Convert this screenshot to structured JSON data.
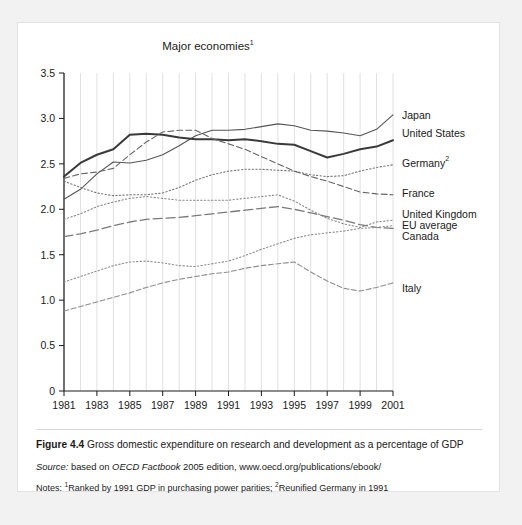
{
  "figure": {
    "caption_number": "Figure 4.4",
    "caption_text": " Gross domestic expenditure on research and development as a percentage of GDP",
    "source_lead": "Source:",
    "source_rest_a": " based on ",
    "source_italic": "OECD Factbook",
    "source_rest_b": " 2005 edition, www.oecd.org/publications/ebook/",
    "notes_lead": "Notes: ",
    "notes_sup1": "1",
    "notes_text1": "Ranked by 1991 GDP in purchasing power parities; ",
    "notes_sup2": "2",
    "notes_text2": "Reunified Germany in 1991"
  },
  "chart_data": {
    "type": "line",
    "title": "Major economies",
    "title_superscript": "1",
    "xlabel": "",
    "ylabel": "",
    "xlim": [
      1981,
      2001
    ],
    "ylim": [
      0,
      3.5
    ],
    "grid": true,
    "legend_position": "right-inline",
    "x": [
      1981,
      1982,
      1983,
      1984,
      1985,
      1986,
      1987,
      1988,
      1989,
      1990,
      1991,
      1992,
      1993,
      1994,
      1995,
      1996,
      1997,
      1998,
      1999,
      2000,
      2001
    ],
    "xticks": [
      1981,
      1983,
      1985,
      1987,
      1989,
      1991,
      1993,
      1995,
      1997,
      1999,
      2001
    ],
    "yticks": [
      "0",
      "0.5",
      "1.0",
      "1.5",
      "2.0",
      "2.5",
      "3.0",
      "3.5"
    ],
    "ytick_values": [
      0,
      0.5,
      1.0,
      1.5,
      2.0,
      2.5,
      3.0,
      3.5
    ],
    "series": [
      {
        "name": "Japan",
        "label": "Japan",
        "style": "solid",
        "width": 1.1,
        "color": "#555555",
        "values": [
          2.11,
          2.22,
          2.39,
          2.52,
          2.51,
          2.54,
          2.6,
          2.7,
          2.81,
          2.87,
          2.87,
          2.88,
          2.91,
          2.94,
          2.92,
          2.87,
          2.86,
          2.84,
          2.81,
          2.88,
          3.04
        ]
      },
      {
        "name": "United States",
        "label": "United States",
        "style": "solid",
        "width": 2.0,
        "color": "#3a3a3a",
        "values": [
          2.36,
          2.51,
          2.6,
          2.66,
          2.82,
          2.83,
          2.82,
          2.79,
          2.77,
          2.77,
          2.76,
          2.77,
          2.75,
          2.72,
          2.71,
          2.64,
          2.57,
          2.61,
          2.66,
          2.69,
          2.76
        ]
      },
      {
        "name": "Germany",
        "label": "Germany",
        "label_superscript": "2",
        "style": "dotted",
        "width": 1.1,
        "color": "#777777",
        "values": [
          2.31,
          2.24,
          2.18,
          2.15,
          2.16,
          2.16,
          2.18,
          2.24,
          2.32,
          2.38,
          2.42,
          2.44,
          2.44,
          2.43,
          2.42,
          2.38,
          2.36,
          2.37,
          2.42,
          2.46,
          2.49
        ]
      },
      {
        "name": "France",
        "label": "France",
        "style": "dashed",
        "width": 1.1,
        "color": "#666666",
        "values": [
          2.34,
          2.39,
          2.41,
          2.45,
          2.6,
          2.74,
          2.85,
          2.87,
          2.87,
          2.78,
          2.72,
          2.66,
          2.58,
          2.5,
          2.42,
          2.36,
          2.31,
          2.25,
          2.19,
          2.17,
          2.16
        ]
      },
      {
        "name": "United Kingdom",
        "label": "United Kingdom",
        "style": "dotted",
        "width": 1.1,
        "color": "#8a8a8a",
        "values": [
          1.89,
          1.95,
          2.03,
          2.08,
          2.12,
          2.14,
          2.12,
          2.1,
          2.1,
          2.1,
          2.1,
          2.12,
          2.14,
          2.16,
          2.09,
          1.99,
          1.9,
          1.84,
          1.8,
          1.86,
          1.88
        ]
      },
      {
        "name": "EU average",
        "label": "EU average",
        "style": "longdash",
        "width": 1.3,
        "color": "#7a7a7a",
        "values": [
          1.7,
          1.73,
          1.77,
          1.82,
          1.86,
          1.89,
          1.9,
          1.91,
          1.93,
          1.95,
          1.97,
          1.99,
          2.01,
          2.03,
          2.0,
          1.96,
          1.92,
          1.88,
          1.83,
          1.8,
          1.79
        ]
      },
      {
        "name": "Canada",
        "label": "Canada",
        "style": "dotted",
        "width": 1.1,
        "color": "#8e8e8e",
        "values": [
          1.2,
          1.26,
          1.32,
          1.38,
          1.42,
          1.43,
          1.41,
          1.38,
          1.37,
          1.4,
          1.43,
          1.49,
          1.56,
          1.62,
          1.68,
          1.72,
          1.74,
          1.76,
          1.79,
          1.8,
          1.82
        ]
      },
      {
        "name": "Italy",
        "label": "Italy",
        "style": "dashdot",
        "width": 1.1,
        "color": "#8e8e8e",
        "values": [
          0.88,
          0.93,
          0.98,
          1.03,
          1.08,
          1.14,
          1.19,
          1.23,
          1.26,
          1.29,
          1.31,
          1.35,
          1.38,
          1.4,
          1.42,
          1.31,
          1.21,
          1.13,
          1.1,
          1.14,
          1.19
        ]
      }
    ],
    "label_positions": [
      {
        "name": "Japan",
        "y": 3.03
      },
      {
        "name": "United States",
        "y": 2.83
      },
      {
        "name": "Germany",
        "y": 2.5
      },
      {
        "name": "France",
        "y": 2.18
      },
      {
        "name": "United Kingdom",
        "y": 1.94
      },
      {
        "name": "EU average",
        "y": 1.82
      },
      {
        "name": "Canada",
        "y": 1.7
      },
      {
        "name": "Italy",
        "y": 1.13
      }
    ]
  }
}
